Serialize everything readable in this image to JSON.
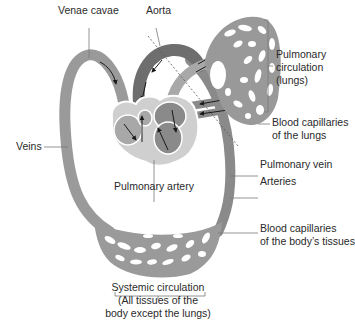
{
  "diagram": {
    "colors": {
      "vessel": "#8f8f8f",
      "vessel_dark": "#6e6e6e",
      "vessel_light": "#b4b4b4",
      "heart_outline": "#ffffff",
      "capillary_holes": "#ffffff",
      "leader_line": "#7a7a7a",
      "arrow": "#1a1a1a"
    },
    "labels": {
      "venae_cavae": "Venae cavae",
      "aorta": "Aorta",
      "pulmonary_circulation_1": "Pulmonary",
      "pulmonary_circulation_2": "circulation",
      "pulmonary_circulation_3": "(lungs)",
      "blood_capillaries_lungs_1": "Blood capillaries",
      "blood_capillaries_lungs_2": "of the lungs",
      "veins": "Veins",
      "pulmonary_vein": "Pulmonary vein",
      "pulmonary_artery": "Pulmonary artery",
      "arteries": "Arteries",
      "blood_capillaries_body_1": "Blood capillaries",
      "blood_capillaries_body_2": "of the body’s tissues",
      "systemic_circulation_1": "Systemic circulation",
      "systemic_circulation_2": "(All tissues of the",
      "systemic_circulation_3": "body except the lungs)"
    }
  }
}
